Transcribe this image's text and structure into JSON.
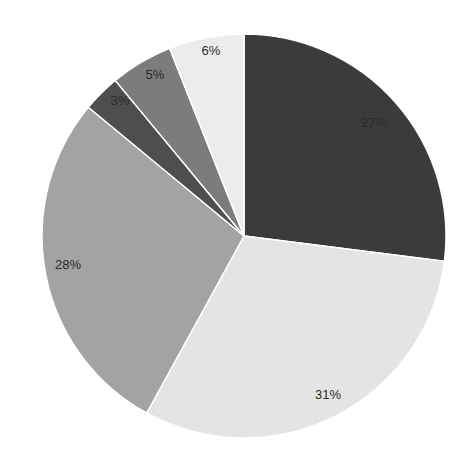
{
  "chart_data": {
    "type": "pie",
    "title": "",
    "start_angle_deg": 0,
    "direction": "clockwise",
    "center": [
      244,
      236
    ],
    "radius": 202,
    "slices": [
      {
        "label": "27%",
        "value": 27,
        "color": "#3b3b3b",
        "label_pos": [
          374,
          124
        ]
      },
      {
        "label": "31%",
        "value": 31,
        "color": "#e4e4e4",
        "label_pos": [
          328,
          396
        ]
      },
      {
        "label": "28%",
        "value": 28,
        "color": "#a3a3a3",
        "label_pos": [
          68,
          266
        ]
      },
      {
        "label": "3%",
        "value": 3,
        "color": "#4e4e4e",
        "label_pos": [
          120,
          102
        ]
      },
      {
        "label": "5%",
        "value": 5,
        "color": "#7c7c7c",
        "label_pos": [
          155,
          76
        ]
      },
      {
        "label": "6%",
        "value": 6,
        "color": "#ececec",
        "label_pos": [
          211,
          52
        ]
      }
    ],
    "legend": null,
    "data_labels": [
      "27%",
      "31%",
      "28%",
      "3%",
      "5%",
      "6%"
    ]
  }
}
